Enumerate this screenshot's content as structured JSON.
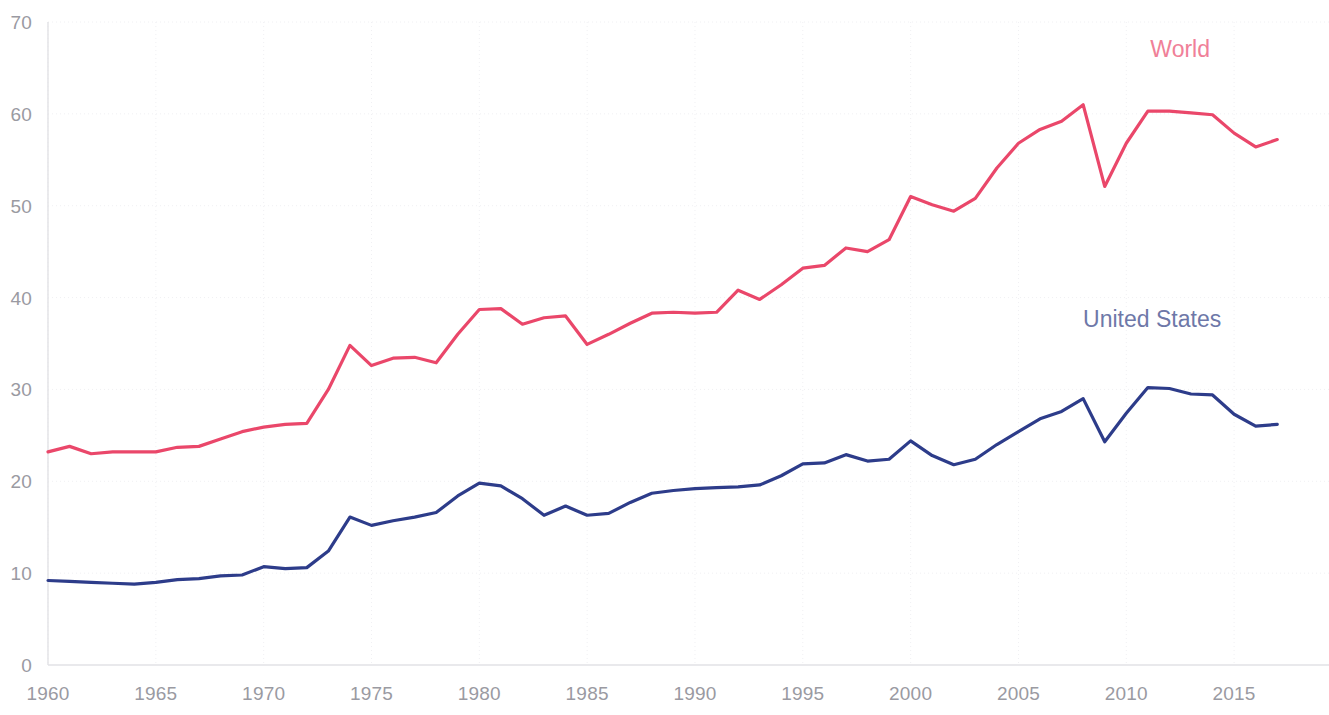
{
  "chart_data": {
    "type": "line",
    "title": "",
    "subtitle": "",
    "xlabel": "",
    "ylabel": "",
    "xlim": [
      1960,
      2017
    ],
    "ylim": [
      0,
      70
    ],
    "y_ticks": [
      0,
      10,
      20,
      30,
      40,
      50,
      60,
      70
    ],
    "x_ticks": [
      1960,
      1965,
      1970,
      1975,
      1980,
      1985,
      1990,
      1995,
      2000,
      2005,
      2010,
      2015
    ],
    "grid": true,
    "legend_position": "inline-right",
    "x": [
      1960,
      1961,
      1962,
      1963,
      1964,
      1965,
      1966,
      1967,
      1968,
      1969,
      1970,
      1971,
      1972,
      1973,
      1974,
      1975,
      1976,
      1977,
      1978,
      1979,
      1980,
      1981,
      1982,
      1983,
      1984,
      1985,
      1986,
      1987,
      1988,
      1989,
      1990,
      1991,
      1992,
      1993,
      1994,
      1995,
      1996,
      1997,
      1998,
      1999,
      2000,
      2001,
      2002,
      2003,
      2004,
      2005,
      2006,
      2007,
      2008,
      2009,
      2010,
      2011,
      2012,
      2013,
      2014,
      2015,
      2016,
      2017
    ],
    "series": [
      {
        "name": "World",
        "color": "#ea476a",
        "label_color": "#f08098",
        "values": [
          23.2,
          23.8,
          23.0,
          23.2,
          23.2,
          23.2,
          23.7,
          23.8,
          24.6,
          25.4,
          25.9,
          26.2,
          26.3,
          30.0,
          34.8,
          32.6,
          33.4,
          33.5,
          32.9,
          36.0,
          38.7,
          38.8,
          37.1,
          37.8,
          38.0,
          34.9,
          36.0,
          37.2,
          38.3,
          38.4,
          38.3,
          38.4,
          40.8,
          39.8,
          41.4,
          43.2,
          43.5,
          45.4,
          45.0,
          46.3,
          51.0,
          50.1,
          49.4,
          50.8,
          54.1,
          56.8,
          58.3,
          59.2,
          61.0,
          52.1,
          56.8,
          60.3,
          60.3,
          60.1,
          59.9,
          57.9,
          56.4,
          57.2
        ]
      },
      {
        "name": "United States",
        "color": "#2d3c8a",
        "label_color": "#6e78a8",
        "values": [
          9.2,
          9.1,
          9.0,
          8.9,
          8.8,
          9.0,
          9.3,
          9.4,
          9.7,
          9.8,
          10.7,
          10.5,
          10.6,
          12.4,
          16.1,
          15.2,
          15.7,
          16.1,
          16.6,
          18.4,
          19.8,
          19.5,
          18.1,
          16.3,
          17.3,
          16.3,
          16.5,
          17.7,
          18.7,
          19.0,
          19.2,
          19.3,
          19.4,
          19.6,
          20.6,
          21.9,
          22.0,
          22.9,
          22.2,
          22.4,
          24.4,
          22.8,
          21.8,
          22.4,
          24.0,
          25.4,
          26.8,
          27.6,
          29.0,
          24.3,
          27.4,
          30.2,
          30.1,
          29.5,
          29.4,
          27.3,
          26.0,
          26.2
        ]
      }
    ],
    "annotations": [
      {
        "text": "World",
        "x": 2012.5,
        "y": 66.2,
        "series": "World"
      },
      {
        "text": "United States",
        "x": 2011.2,
        "y": 36.8,
        "series": "United States"
      }
    ]
  },
  "axes": {
    "y_tick_labels": [
      "70",
      "60",
      "50",
      "40",
      "30",
      "20",
      "10",
      "0"
    ],
    "x_tick_labels": [
      "1960",
      "1965",
      "1970",
      "1975",
      "1980",
      "1985",
      "1990",
      "1995",
      "2000",
      "2005",
      "2010",
      "2015"
    ]
  },
  "colors": {
    "world": "#ea476a",
    "world_label": "#f08098",
    "united_states": "#2d3c8a",
    "united_states_label": "#6e78a8",
    "tick_text": "#9a9aa2",
    "gridline": "#f0f0f3",
    "axis": "#e2e2e6",
    "background": "#ffffff"
  }
}
